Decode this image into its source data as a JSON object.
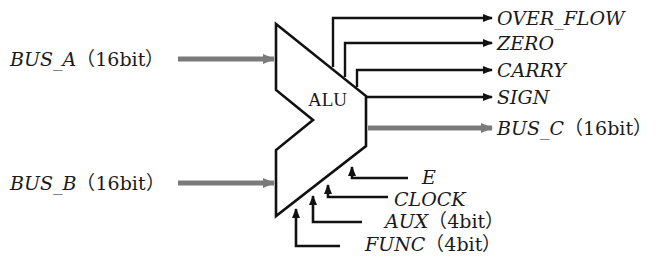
{
  "diagram": {
    "block": {
      "label": "ALU"
    },
    "inputs": [
      {
        "name": "BUS_A",
        "width": "（16bit）"
      },
      {
        "name": "BUS_B",
        "width": "（16bit）"
      }
    ],
    "outputs": [
      {
        "name": "OVER_FLOW"
      },
      {
        "name": "ZERO"
      },
      {
        "name": "CARRY"
      },
      {
        "name": "SIGN"
      },
      {
        "name": "BUS_C",
        "width": "（16bit）"
      }
    ],
    "controls": [
      {
        "name": "E"
      },
      {
        "name": "CLOCK"
      },
      {
        "name": "AUX",
        "width": "（4bit）"
      },
      {
        "name": "FUNC",
        "width": "（4bit）"
      }
    ],
    "colors": {
      "line": "#111111",
      "bus": "#7a7a7a"
    }
  }
}
